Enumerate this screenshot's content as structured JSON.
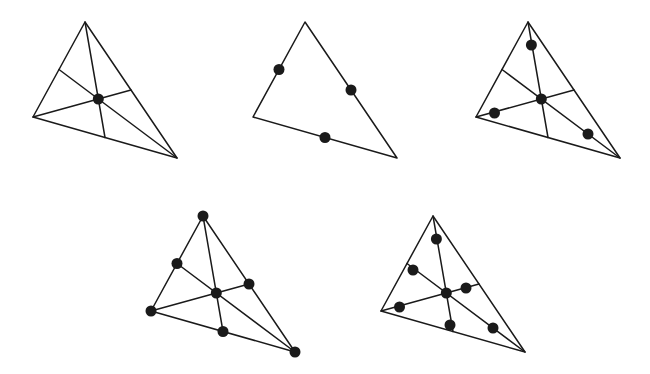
{
  "figure": {
    "canvas": {
      "width": 650,
      "height": 374,
      "background": "#ffffff"
    },
    "style": {
      "line_color": "#1a1a1a",
      "dot_color": "#1a1a1a",
      "edge_stroke_width": 1.5,
      "median_stroke_width": 1.5,
      "dot_radius": 5.5
    },
    "panels": [
      {
        "id": "panel-1",
        "label": "top-left",
        "position": "top row, first",
        "has_medians": true,
        "dot_count": 1,
        "dot_description": "single dot at the centroid",
        "vertices": {
          "apex": {
            "x": 85,
            "y": 22
          },
          "left": {
            "x": 33,
            "y": 117
          },
          "right": {
            "x": 177,
            "y": 158
          }
        },
        "midpoints": {
          "apex_left": {
            "x": 59,
            "y": 69.5
          },
          "left_right": {
            "x": 105,
            "y": 137.5
          },
          "apex_right": {
            "x": 131,
            "y": 90
          }
        },
        "centroid": {
          "x": 98.3,
          "y": 99
        },
        "medians": [
          {
            "from": "apex",
            "to": "left_right"
          },
          {
            "from": "left",
            "to": "apex_right"
          },
          {
            "from": "right",
            "to": "apex_left"
          }
        ],
        "dots": [
          {
            "name": "centroid",
            "x": 98.3,
            "y": 99
          }
        ]
      },
      {
        "id": "panel-2",
        "label": "top-middle",
        "position": "top row, second",
        "has_medians": false,
        "dot_count": 3,
        "dot_description": "three dots at the midpoints of the three sides, no interior lines",
        "vertices": {
          "apex": {
            "x": 305,
            "y": 22
          },
          "left": {
            "x": 253,
            "y": 117
          },
          "right": {
            "x": 397,
            "y": 158
          }
        },
        "midpoints": {
          "apex_left": {
            "x": 279,
            "y": 69.5
          },
          "left_right": {
            "x": 325,
            "y": 137.5
          },
          "apex_right": {
            "x": 351,
            "y": 90
          }
        },
        "centroid": {
          "x": 318.3,
          "y": 99
        },
        "medians": [],
        "dots": [
          {
            "name": "midpoint-apex-left",
            "x": 279,
            "y": 69.5
          },
          {
            "name": "midpoint-apex-right",
            "x": 351,
            "y": 90
          },
          {
            "name": "midpoint-left-right",
            "x": 325,
            "y": 137.5
          }
        ]
      },
      {
        "id": "panel-3",
        "label": "top-right",
        "position": "top row, third",
        "has_medians": true,
        "dot_count": 4,
        "dot_description": "centroid plus three dots on the medians between each vertex and the centroid",
        "vertices": {
          "apex": {
            "x": 528,
            "y": 22
          },
          "left": {
            "x": 476,
            "y": 117
          },
          "right": {
            "x": 620,
            "y": 158
          }
        },
        "midpoints": {
          "apex_left": {
            "x": 502,
            "y": 69.5
          },
          "left_right": {
            "x": 548,
            "y": 137.5
          },
          "apex_right": {
            "x": 574,
            "y": 90
          }
        },
        "centroid": {
          "x": 541.3,
          "y": 99
        },
        "medians": [
          {
            "from": "apex",
            "to": "left_right"
          },
          {
            "from": "left",
            "to": "apex_right"
          },
          {
            "from": "right",
            "to": "apex_left"
          }
        ],
        "dots": [
          {
            "name": "centroid",
            "x": 541.3,
            "y": 99
          },
          {
            "name": "median-point-from-apex",
            "x": 531.4,
            "y": 45
          },
          {
            "name": "median-point-from-left",
            "x": 494.5,
            "y": 113
          },
          {
            "name": "median-point-from-right",
            "x": 588,
            "y": 134
          }
        ]
      },
      {
        "id": "panel-4",
        "label": "bottom-left",
        "position": "bottom row, first",
        "has_medians": true,
        "dot_count": 7,
        "dot_description": "three vertices, three side midpoints, and the centroid",
        "vertices": {
          "apex": {
            "x": 203,
            "y": 216
          },
          "left": {
            "x": 151,
            "y": 311
          },
          "right": {
            "x": 295,
            "y": 352
          }
        },
        "midpoints": {
          "apex_left": {
            "x": 177,
            "y": 263.5
          },
          "left_right": {
            "x": 223,
            "y": 331.5
          },
          "apex_right": {
            "x": 249,
            "y": 284
          }
        },
        "centroid": {
          "x": 216.3,
          "y": 293
        },
        "medians": [
          {
            "from": "apex",
            "to": "left_right"
          },
          {
            "from": "left",
            "to": "apex_right"
          },
          {
            "from": "right",
            "to": "apex_left"
          }
        ],
        "dots": [
          {
            "name": "vertex-apex",
            "x": 203,
            "y": 216
          },
          {
            "name": "vertex-left",
            "x": 151,
            "y": 311
          },
          {
            "name": "vertex-right",
            "x": 295,
            "y": 352
          },
          {
            "name": "midpoint-apex-left",
            "x": 177,
            "y": 263.5
          },
          {
            "name": "midpoint-apex-right",
            "x": 249,
            "y": 284
          },
          {
            "name": "midpoint-left-right",
            "x": 223,
            "y": 331.5
          },
          {
            "name": "centroid",
            "x": 216.3,
            "y": 293
          }
        ]
      },
      {
        "id": "panel-5",
        "label": "bottom-right",
        "position": "bottom row, second",
        "has_medians": true,
        "dot_count": 7,
        "dot_description": "centroid plus six dots placed along the medians, three between the vertices and the centroid and three between the centroid and the side midpoints",
        "vertices": {
          "apex": {
            "x": 433,
            "y": 216
          },
          "left": {
            "x": 381,
            "y": 311
          },
          "right": {
            "x": 525,
            "y": 352
          }
        },
        "midpoints": {
          "apex_left": {
            "x": 407,
            "y": 263.5
          },
          "left_right": {
            "x": 453,
            "y": 331.5
          },
          "apex_right": {
            "x": 479,
            "y": 284
          }
        },
        "centroid": {
          "x": 446.3,
          "y": 293
        },
        "medians": [
          {
            "from": "apex",
            "to": "left_right"
          },
          {
            "from": "left",
            "to": "apex_right"
          },
          {
            "from": "right",
            "to": "apex_left"
          }
        ],
        "dots": [
          {
            "name": "centroid",
            "x": 446.3,
            "y": 293
          },
          {
            "name": "median-point-from-apex",
            "x": 436.4,
            "y": 239
          },
          {
            "name": "median-point-from-left",
            "x": 399.5,
            "y": 307
          },
          {
            "name": "median-point-from-right",
            "x": 493,
            "y": 328
          },
          {
            "name": "median-point-toward-apex-left-midpoint",
            "x": 413,
            "y": 270
          },
          {
            "name": "median-point-toward-apex-right-midpoint",
            "x": 466,
            "y": 288
          },
          {
            "name": "median-point-toward-left-right-midpoint",
            "x": 450,
            "y": 325
          }
        ]
      }
    ]
  }
}
